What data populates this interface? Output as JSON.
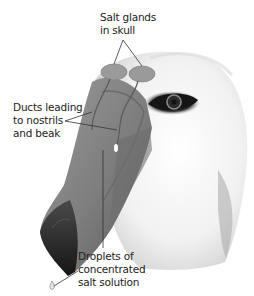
{
  "figure": {
    "labels": {
      "salt_glands": [
        "Salt glands",
        "in skull"
      ],
      "ducts": [
        "Ducts leading",
        "to nostrils",
        "and beak"
      ],
      "droplets": [
        "Droplets of",
        "concentrated",
        "salt solution"
      ]
    },
    "colors": {
      "gland": "#9a9a9a",
      "beak_light": "#8e8e8e",
      "beak_dark": "#2a2a2a",
      "head": "#f2f2f2",
      "eye": "#1a1a1a",
      "leader_line": "#333333"
    }
  }
}
